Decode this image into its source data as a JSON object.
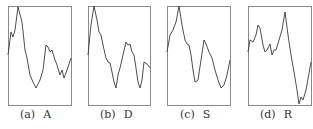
{
  "chart_data": [
    {
      "type": "line",
      "title": "",
      "panel_label": "(a)",
      "name": "A",
      "box": {
        "x": 8,
        "y": 6,
        "w": 63,
        "h": 99
      },
      "points": [
        [
          8,
          55
        ],
        [
          11,
          32
        ],
        [
          13,
          37
        ],
        [
          15,
          30
        ],
        [
          18,
          7
        ],
        [
          22,
          22
        ],
        [
          25,
          50
        ],
        [
          27,
          58
        ],
        [
          30,
          75
        ],
        [
          33,
          82
        ],
        [
          36,
          88
        ],
        [
          40,
          80
        ],
        [
          43,
          70
        ],
        [
          46,
          45
        ],
        [
          48,
          47
        ],
        [
          50,
          52
        ],
        [
          52,
          50
        ],
        [
          55,
          60
        ],
        [
          57,
          65
        ],
        [
          60,
          75
        ],
        [
          62,
          70
        ],
        [
          64,
          78
        ],
        [
          67,
          70
        ],
        [
          71,
          58
        ]
      ],
      "xlabel": "",
      "ylabel": "",
      "grid": false
    },
    {
      "type": "line",
      "title": "",
      "panel_label": "(b)",
      "name": "D",
      "box": {
        "x": 88,
        "y": 6,
        "w": 62,
        "h": 99
      },
      "points": [
        [
          88,
          55
        ],
        [
          91,
          25
        ],
        [
          94,
          6
        ],
        [
          97,
          20
        ],
        [
          99,
          32
        ],
        [
          101,
          35
        ],
        [
          103,
          45
        ],
        [
          106,
          58
        ],
        [
          108,
          62
        ],
        [
          110,
          63
        ],
        [
          112,
          72
        ],
        [
          114,
          82
        ],
        [
          116,
          88
        ],
        [
          118,
          75
        ],
        [
          120,
          68
        ],
        [
          123,
          55
        ],
        [
          126,
          42
        ],
        [
          128,
          45
        ],
        [
          130,
          44
        ],
        [
          132,
          52
        ],
        [
          134,
          55
        ],
        [
          136,
          68
        ],
        [
          138,
          82
        ],
        [
          140,
          88
        ],
        [
          142,
          80
        ],
        [
          144,
          62
        ],
        [
          147,
          64
        ],
        [
          150,
          68
        ]
      ],
      "xlabel": "",
      "ylabel": "",
      "grid": false
    },
    {
      "type": "line",
      "title": "",
      "panel_label": "(c)",
      "name": "S",
      "box": {
        "x": 167,
        "y": 6,
        "w": 63,
        "h": 99
      },
      "points": [
        [
          167,
          52
        ],
        [
          170,
          35
        ],
        [
          173,
          30
        ],
        [
          176,
          22
        ],
        [
          179,
          6
        ],
        [
          182,
          25
        ],
        [
          185,
          40
        ],
        [
          187,
          44
        ],
        [
          189,
          45
        ],
        [
          191,
          55
        ],
        [
          193,
          70
        ],
        [
          195,
          82
        ],
        [
          198,
          80
        ],
        [
          201,
          60
        ],
        [
          204,
          40
        ],
        [
          206,
          44
        ],
        [
          209,
          52
        ],
        [
          212,
          58
        ],
        [
          215,
          70
        ],
        [
          218,
          80
        ],
        [
          221,
          88
        ],
        [
          224,
          85
        ],
        [
          227,
          75
        ],
        [
          230,
          60
        ]
      ],
      "xlabel": "",
      "ylabel": "",
      "grid": false
    },
    {
      "type": "line",
      "title": "",
      "panel_label": "(d)",
      "name": "R",
      "box": {
        "x": 248,
        "y": 6,
        "w": 63,
        "h": 99
      },
      "points": [
        [
          248,
          52
        ],
        [
          250,
          40
        ],
        [
          253,
          42
        ],
        [
          256,
          35
        ],
        [
          258,
          25
        ],
        [
          260,
          28
        ],
        [
          263,
          45
        ],
        [
          265,
          52
        ],
        [
          267,
          50
        ],
        [
          270,
          44
        ],
        [
          272,
          55
        ],
        [
          274,
          50
        ],
        [
          276,
          50
        ],
        [
          279,
          40
        ],
        [
          282,
          30
        ],
        [
          285,
          12
        ],
        [
          288,
          35
        ],
        [
          291,
          55
        ],
        [
          294,
          72
        ],
        [
          297,
          90
        ],
        [
          299,
          104
        ],
        [
          301,
          97
        ],
        [
          303,
          100
        ],
        [
          306,
          90
        ],
        [
          311,
          62
        ]
      ],
      "xlabel": "",
      "ylabel": "",
      "grid": false
    }
  ],
  "captions": [
    {
      "sub": "(a)",
      "name": "A",
      "left": 20
    },
    {
      "sub": "(b)",
      "name": "D",
      "left": 100
    },
    {
      "sub": "(c)",
      "name": "S",
      "left": 180
    },
    {
      "sub": "(d)",
      "name": "R",
      "left": 260
    }
  ],
  "colors": {
    "frame": "#8a8a8a",
    "curve": "#3a3a3a"
  }
}
